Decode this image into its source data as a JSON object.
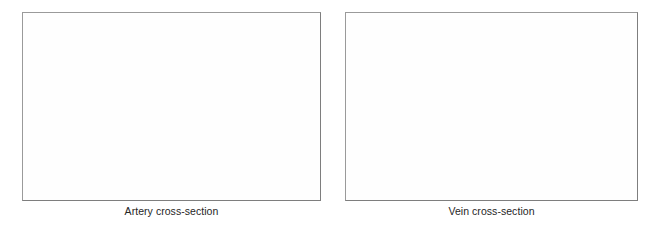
{
  "figure": {
    "background_color": "#ffffff",
    "frame_border_color": "#8a8a8a",
    "caption_color": "#262626",
    "panels": [
      {
        "id": "artery",
        "caption": "Artery cross-section",
        "image_alt": "",
        "image_state": "blank"
      },
      {
        "id": "vein",
        "caption": "Vein cross-section",
        "image_alt": "",
        "image_state": "blank"
      }
    ]
  }
}
